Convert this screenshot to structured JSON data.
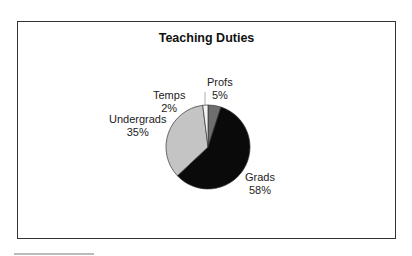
{
  "chart_data": {
    "type": "pie",
    "title": "Teaching Duties",
    "categories": [
      "Profs",
      "Grads",
      "Undergrads",
      "Temps"
    ],
    "values": [
      5,
      58,
      35,
      2
    ],
    "unit": "%",
    "colors": [
      "#6e6e6e",
      "#0a0a0a",
      "#c4c4c4",
      "#f2f2f2"
    ],
    "labels": [
      {
        "name": "Profs",
        "pct": "5%"
      },
      {
        "name": "Grads",
        "pct": "58%"
      },
      {
        "name": "Undergrads",
        "pct": "35%"
      },
      {
        "name": "Temps",
        "pct": "2%"
      }
    ],
    "legend": "none (data labels outside slices)",
    "start_angle_deg": 0,
    "direction": "clockwise"
  }
}
